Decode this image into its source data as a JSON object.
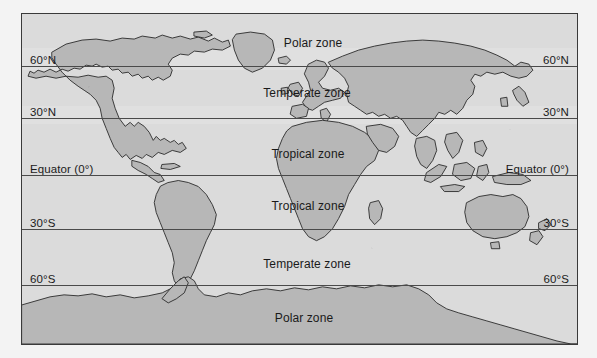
{
  "figure": {
    "kind": "world-map-climate-zones",
    "frame": {
      "x": 21,
      "y": 13,
      "width": 557,
      "height": 332
    },
    "colors": {
      "page_background": "#f3f3f3",
      "ocean": "#dbdbdb",
      "land": "#b7b7b7",
      "land_outline": "#2b2b2b",
      "frame_border": "#3a3a3a",
      "latitude_line": "#4a4a4a",
      "text": "#1a1a1a"
    }
  },
  "latitudes": [
    {
      "id": "lat-60n",
      "label_left": "60°N",
      "label_right": "60°N",
      "line_y": 52,
      "label_y": 40
    },
    {
      "id": "lat-30n",
      "label_left": "30°N",
      "label_right": "30°N",
      "line_y": 104,
      "label_y": 92
    },
    {
      "id": "lat-equator",
      "label_left": "Equator (0°)",
      "label_right": "Equator (0°)",
      "line_y": 161,
      "label_y": 149
    },
    {
      "id": "lat-30s",
      "label_left": "30°S",
      "label_right": "30°S",
      "line_y": 215,
      "label_y": 203
    },
    {
      "id": "lat-60s",
      "label_left": "60°S",
      "label_right": "60°S",
      "line_y": 271,
      "label_y": 259
    }
  ],
  "zone_labels": [
    {
      "id": "zone-polar-north",
      "text": "Polar zone",
      "x": 291,
      "y": 22
    },
    {
      "id": "zone-temperate-north",
      "text": "Temperate zone",
      "x": 285,
      "y": 72
    },
    {
      "id": "zone-tropical-north",
      "text": "Tropical zone",
      "x": 286,
      "y": 133
    },
    {
      "id": "zone-tropical-south",
      "text": "Tropical zone",
      "x": 286,
      "y": 185
    },
    {
      "id": "zone-temperate-south",
      "text": "Temperate zone",
      "x": 285,
      "y": 243
    },
    {
      "id": "zone-polar-south",
      "text": "Polar zone",
      "x": 282,
      "y": 297
    }
  ],
  "haze_bands": [
    {
      "id": "haze-60n",
      "top": 34,
      "height": 22
    },
    {
      "id": "haze-30n",
      "top": 92,
      "height": 18
    }
  ],
  "landmasses": [
    {
      "name": "north-america"
    },
    {
      "name": "greenland"
    },
    {
      "name": "south-america"
    },
    {
      "name": "europe"
    },
    {
      "name": "africa"
    },
    {
      "name": "asia"
    },
    {
      "name": "india"
    },
    {
      "name": "southeast-asia-islands"
    },
    {
      "name": "australia"
    },
    {
      "name": "new-zealand"
    },
    {
      "name": "madagascar"
    },
    {
      "name": "japan"
    },
    {
      "name": "british-isles"
    },
    {
      "name": "antarctica"
    }
  ],
  "chart_data": {
    "type": "map",
    "projection": "cylindrical",
    "xlabel": "",
    "ylabel": "Latitude",
    "x": [
      -180,
      180
    ],
    "ylim": [
      90,
      -90
    ],
    "grid": true,
    "legend": "none",
    "categories": [
      "Polar zone",
      "Temperate zone",
      "Tropical zone"
    ],
    "tick_labels": [
      "60°N",
      "30°N",
      "Equator (0°)",
      "30°S",
      "60°S"
    ],
    "tick_values": [
      60,
      30,
      0,
      -30,
      -60
    ],
    "bands": [
      {
        "name": "Polar zone",
        "lat_from": 90,
        "lat_to": 60,
        "hemisphere": "north"
      },
      {
        "name": "Temperate zone",
        "lat_from": 60,
        "lat_to": 30,
        "hemisphere": "north"
      },
      {
        "name": "Tropical zone",
        "lat_from": 30,
        "lat_to": 0,
        "hemisphere": "north"
      },
      {
        "name": "Tropical zone",
        "lat_from": 0,
        "lat_to": -30,
        "hemisphere": "south"
      },
      {
        "name": "Temperate zone",
        "lat_from": -30,
        "lat_to": -60,
        "hemisphere": "south"
      },
      {
        "name": "Polar zone",
        "lat_from": -60,
        "lat_to": -90,
        "hemisphere": "south"
      }
    ]
  }
}
